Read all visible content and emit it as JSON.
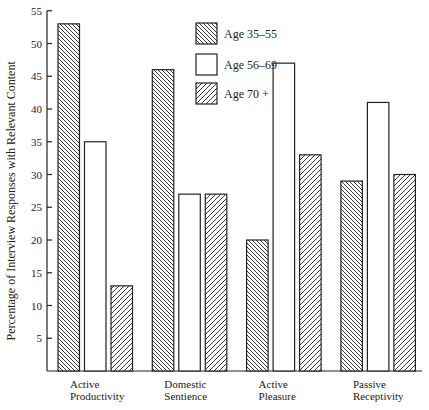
{
  "chart_data": {
    "type": "bar",
    "title": "",
    "xlabel": "",
    "ylabel": "Percentage of Interview Responses with Relevant Content",
    "ylim": [
      0,
      55
    ],
    "yticks": [
      5,
      10,
      15,
      20,
      25,
      30,
      35,
      40,
      45,
      50,
      55
    ],
    "grid": false,
    "legend_position": "top-center",
    "categories": [
      [
        "Active",
        "Productivity"
      ],
      [
        "Domestic",
        "Sentience"
      ],
      [
        "Active",
        "Pleasure"
      ],
      [
        "Passive",
        "Receptivity"
      ]
    ],
    "series": [
      {
        "name": "Age 35–55",
        "pattern": "hatch-backslash",
        "values": [
          53,
          46,
          20,
          29
        ]
      },
      {
        "name": "Age 56–69",
        "pattern": "empty",
        "values": [
          35,
          27,
          47,
          41
        ]
      },
      {
        "name": "Age 70 +",
        "pattern": "hatch-slash",
        "values": [
          13,
          27,
          33,
          30
        ]
      }
    ],
    "colors": {
      "line": "#222222",
      "background": "#ffffff"
    }
  }
}
